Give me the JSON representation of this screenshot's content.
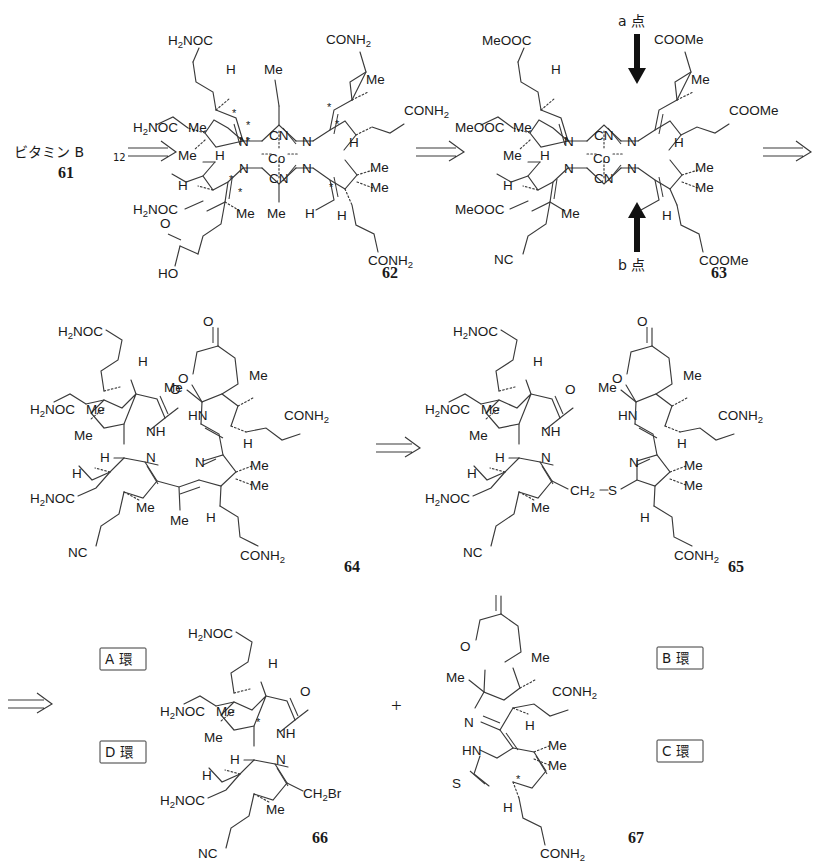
{
  "page": {
    "width": 827,
    "height": 862,
    "background": "#ffffff",
    "ink": "#3a3a3a"
  },
  "start_material": {
    "name": "ビタミン B12",
    "name_main": "ビタミン B",
    "name_sub": "12",
    "number": "61"
  },
  "arrows": {
    "retro": "⇒",
    "plus": "+",
    "down_label": "a 点",
    "up_label": "b 点"
  },
  "compounds": [
    {
      "number": "62",
      "name": "cobyrinic acid heptaamide (Co-dicyano corrin)",
      "metal": "Co",
      "axial_ligands": [
        "CN",
        "CN"
      ],
      "ring_nitrogens": [
        "N",
        "N",
        "N",
        "N"
      ],
      "labels": [
        "H2NOC",
        "CONH2",
        "H2NOC",
        "CONH2",
        "H2NOC",
        "CONH2",
        "HO",
        "O",
        "Me",
        "H"
      ],
      "stereocenters": 9
    },
    {
      "number": "63",
      "name": "heptamethyl ester cyano-corrin",
      "metal": "Co",
      "axial_ligands": [
        "CN",
        "CN"
      ],
      "labels": [
        "MeOOC",
        "COOMe",
        "NC",
        "Me",
        "H"
      ],
      "annotations": [
        "a 点",
        "b 点"
      ]
    },
    {
      "number": "64",
      "name": "A/D - B/C seco-corrin with lactone",
      "labels": [
        "H2NOC",
        "CONH2",
        "NC",
        "Me",
        "H",
        "NH",
        "HN",
        "N",
        "O"
      ]
    },
    {
      "number": "65",
      "name": "thioether-bridged bicyclic precursor",
      "labels": [
        "H2NOC",
        "CONH2",
        "NC",
        "Me",
        "H",
        "NH",
        "HN",
        "N",
        "O",
        "CH2",
        "S"
      ]
    },
    {
      "number": "66",
      "name": "A/D ring bromomethyl fragment",
      "labels": [
        "H2NOC",
        "NC",
        "Me",
        "H",
        "NH",
        "N",
        "O",
        "CH2Br"
      ],
      "ring_tags": [
        "A 環",
        "D 環"
      ]
    },
    {
      "number": "67",
      "name": "B/C ring thiolactam fragment",
      "labels": [
        "CONH2",
        "Me",
        "H",
        "HN",
        "N",
        "O",
        "S"
      ],
      "ring_tags": [
        "B 環",
        "C 環"
      ]
    }
  ],
  "ring_labels": {
    "a": "A 環",
    "b": "B 環",
    "c": "C 環",
    "d": "D 環"
  },
  "atom_text": {
    "co": "Co",
    "cn": "CN",
    "n": "N",
    "nh": "NH",
    "hn": "HN",
    "h": "H",
    "me": "Me",
    "o": "O",
    "s": "S",
    "ho": "HO",
    "nc": "NC",
    "conh2_main": "CONH",
    "conh2_sub": "2",
    "h2noc_h": "H",
    "h2noc_sub": "2",
    "h2noc_noc": "NOC",
    "meooc": "MeOOC",
    "coome": "COOMe",
    "ch2_main": "CH",
    "ch2_sub": "2",
    "ch2br": "Br",
    "star": "*"
  }
}
